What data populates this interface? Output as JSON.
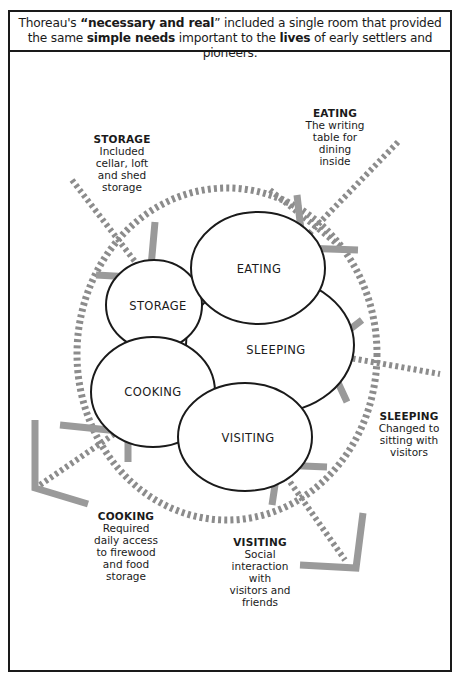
{
  "header": {
    "segments": [
      {
        "text": "Thoreau's ",
        "bold": false
      },
      {
        "text": "“necessary and real",
        "bold": true
      },
      {
        "text": "” included a single room that provided the same ",
        "bold": false
      },
      {
        "text": "simple needs",
        "bold": true
      },
      {
        "text": " important to the ",
        "bold": false
      },
      {
        "text": "lives",
        "bold": true
      },
      {
        "text": " of early settlers and pioneers.",
        "bold": false
      }
    ]
  },
  "ovals": {
    "eating": "EATING",
    "storage": "STORAGE",
    "sleeping": "SLEEPING",
    "cooking": "COOKING",
    "visiting": "VISITING"
  },
  "notes": {
    "storage": {
      "title": "STORAGE",
      "lines": [
        "Included",
        "cellar, loft",
        "and shed",
        "storage"
      ]
    },
    "eating": {
      "title": "EATING",
      "lines": [
        "The writing",
        "table for",
        "dining",
        "inside"
      ]
    },
    "sleeping": {
      "title": "SLEEPING",
      "lines": [
        "Changed to",
        "sitting with",
        "visitors"
      ]
    },
    "cooking": {
      "title": "COOKING",
      "lines": [
        "Required",
        "daily access",
        "to firewood",
        "and food",
        "storage"
      ]
    },
    "visiting": {
      "title": "VISITING",
      "lines": [
        "Social",
        "interaction",
        "with",
        "visitors and",
        "friends"
      ]
    }
  },
  "colors": {
    "ink": "#1a1a1a",
    "dash": "#8c8c8c",
    "arrow": "#9a9a9a"
  }
}
